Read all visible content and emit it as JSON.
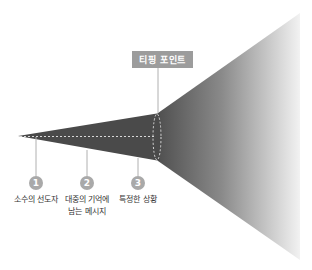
{
  "diagram": {
    "title_label": "티핑 포인트",
    "steps": [
      {
        "number": "1",
        "label_line1": "소수의 선도자",
        "label_line2": ""
      },
      {
        "number": "2",
        "label_line1": "대중의 기억에",
        "label_line2": "남는 메시지"
      },
      {
        "number": "3",
        "label_line1": "특정한 상황",
        "label_line2": ""
      }
    ],
    "colors": {
      "narrow_cone": "#4a4a4a",
      "wide_cone_start": "#505050",
      "wide_cone_end": "#f2f2f2",
      "label_box": "#9c9c9c",
      "step_circle": "#a9a9a9",
      "leader_line": "#b0b0b0"
    }
  }
}
